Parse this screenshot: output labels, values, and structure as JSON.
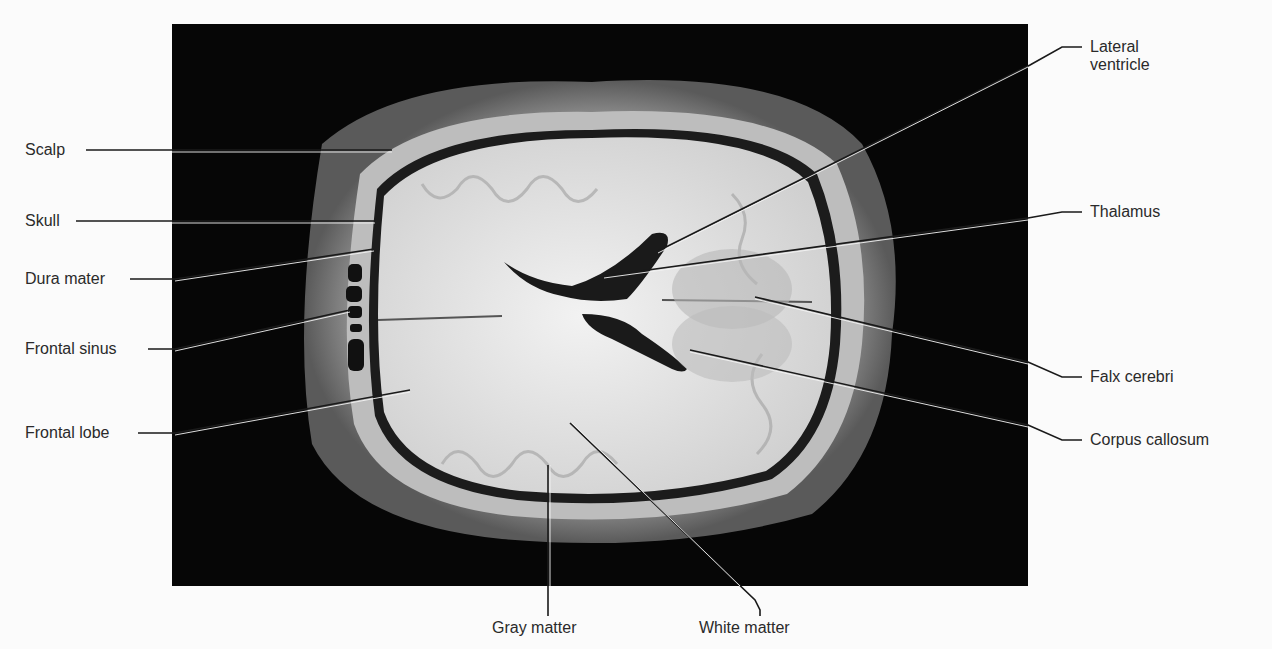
{
  "figure": {
    "photo": {
      "background": "#060606"
    }
  },
  "labels": {
    "left": [
      {
        "id": "scalp",
        "text": "Scalp"
      },
      {
        "id": "skull",
        "text": "Skull"
      },
      {
        "id": "dura-mater",
        "text": "Dura mater"
      },
      {
        "id": "frontal-sinus",
        "text": "Frontal sinus"
      },
      {
        "id": "frontal-lobe",
        "text": "Frontal lobe"
      }
    ],
    "right": [
      {
        "id": "lateral-ventricle",
        "text": "Lateral ventricle",
        "line1": "Lateral",
        "line2": "ventricle"
      },
      {
        "id": "thalamus",
        "text": "Thalamus"
      },
      {
        "id": "falx-cerebri",
        "text": "Falx cerebri"
      },
      {
        "id": "corpus-callosum",
        "text": "Corpus callosum"
      }
    ],
    "bottom": [
      {
        "id": "gray-matter",
        "text": "Gray matter"
      },
      {
        "id": "white-matter",
        "text": "White matter"
      }
    ]
  }
}
